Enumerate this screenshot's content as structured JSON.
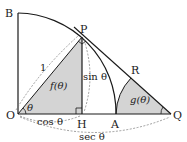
{
  "diagram": {
    "points": {
      "O": {
        "label": "O",
        "x": 18,
        "y": 114
      },
      "B": {
        "label": "B",
        "x": 18,
        "y": 13
      },
      "P": {
        "label": "P",
        "x": 82,
        "y": 37
      },
      "H": {
        "label": "H",
        "x": 82,
        "y": 114
      },
      "A": {
        "label": "A",
        "x": 116,
        "y": 114
      },
      "Q": {
        "label": "Q",
        "x": 171,
        "y": 114
      },
      "R": {
        "label": "R",
        "x": 131,
        "y": 78
      }
    },
    "labels": {
      "one": "1",
      "theta_O": "θ",
      "f_region": "f(θ)",
      "g_region": "g(θ)",
      "sin": "sin θ",
      "cos": "cos θ",
      "sec": "sec θ"
    },
    "colors": {
      "line": "#1a1a1a",
      "shade": "#d4d4d4",
      "dashed": "#777777"
    }
  }
}
